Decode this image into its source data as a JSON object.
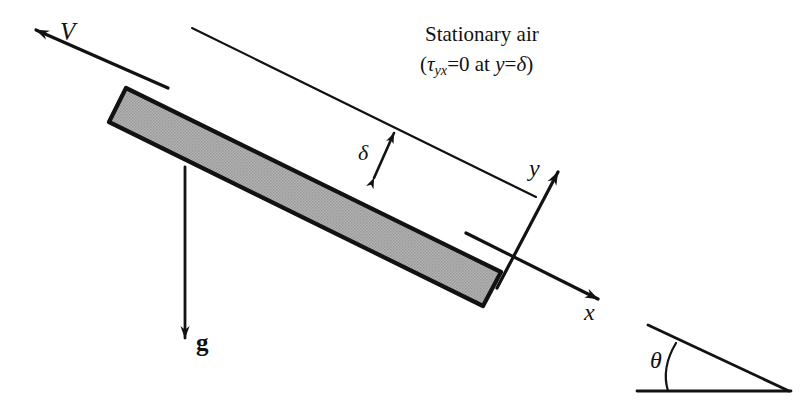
{
  "figure": {
    "background_color": "#ffffff",
    "stroke_color": "#121212",
    "plate_fill_color": "#a9a9a9",
    "plate_border_color": "#121212"
  },
  "labels": {
    "velocity": "V",
    "gravity": "g",
    "film_thickness": "δ",
    "axis_x": "x",
    "axis_y": "y",
    "angle": "θ"
  },
  "annotation": {
    "line1": "Stationary air",
    "line2_open": "(",
    "line2_tau": "τ",
    "line2_tau_sub": "yx",
    "line2_eq_zero": "=0",
    "line2_at": " at ",
    "line2_y": "y",
    "line2_eq_delta": "=",
    "line2_delta": "δ",
    "line2_close": ")"
  },
  "elements": {
    "velocity_arrow_name": "velocity-vector-arrow",
    "gravity_arrow_name": "gravity-vector-arrow",
    "film_thickness_arrow_name": "film-thickness-arrow",
    "x_axis_arrow_name": "x-axis-arrow",
    "y_axis_arrow_name": "y-axis-arrow",
    "plate_name": "inclined-plate",
    "air_boundary_name": "air-boundary-line",
    "incline_inset_name": "incline-angle-inset"
  }
}
